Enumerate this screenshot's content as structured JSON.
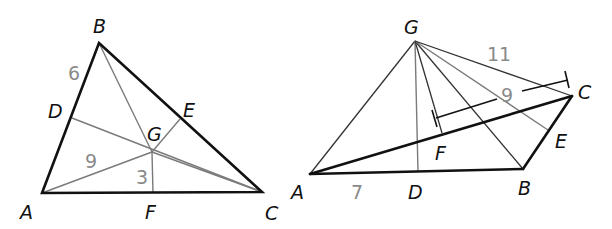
{
  "figures": [
    {
      "id": "left",
      "description": "Triangle ABC with point G joined to D, E, F on the sides",
      "vertices": {
        "A": "A",
        "B": "B",
        "C": "C"
      },
      "points": {
        "D": "D",
        "E": "E",
        "F": "F",
        "G": "G"
      },
      "measures": {
        "BD": "6",
        "AG": "9",
        "GF": "3"
      }
    },
    {
      "id": "right",
      "description": "Triangle ABC with point G above, segments from G to A, D, F, B, E, C",
      "vertices": {
        "A": "A",
        "B": "B",
        "C": "C"
      },
      "points": {
        "D": "D",
        "E": "E",
        "F": "F",
        "G": "G"
      },
      "measures": {
        "AD": "7",
        "GC": "11",
        "FC": "9"
      }
    }
  ]
}
